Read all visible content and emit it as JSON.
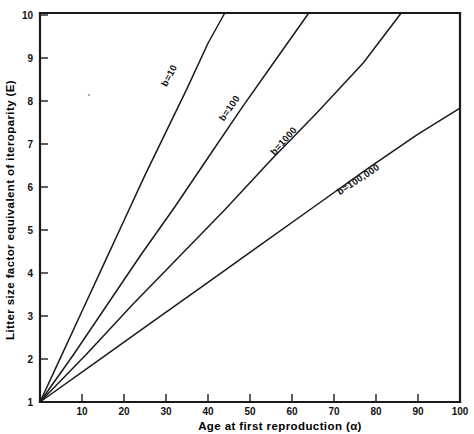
{
  "chart_data": {
    "type": "line",
    "title": "",
    "xlabel": "Age at first reproduction (α)",
    "ylabel": "Litter size factor equivalent of iteroparity (E)",
    "xlim": [
      0,
      100
    ],
    "ylim": [
      1,
      10
    ],
    "grid": false,
    "legend": "inline-curve-labels",
    "x_ticks": [
      10,
      20,
      30,
      40,
      50,
      60,
      70,
      80,
      90,
      100
    ],
    "x_tick_labels": [
      "10",
      "20",
      "30",
      "40",
      "50",
      "60",
      "70",
      "80",
      "90",
      "100"
    ],
    "y_ticks": [
      1,
      2,
      3,
      4,
      5,
      6,
      7,
      8,
      9,
      10
    ],
    "y_tick_labels": [
      "1",
      "2",
      "3",
      "4",
      "5",
      "6",
      "7",
      "8",
      "9",
      "10"
    ],
    "series": [
      {
        "name": "b=10",
        "label": "b=10",
        "x": [
          0,
          5,
          10,
          15,
          20,
          25,
          30,
          35,
          40,
          44
        ],
        "values": [
          1.0,
          2.05,
          3.1,
          4.15,
          5.2,
          6.25,
          7.25,
          8.25,
          9.3,
          10.0
        ]
      },
      {
        "name": "b=100",
        "label": "b=100",
        "x": [
          0,
          8,
          16,
          24,
          32,
          40,
          48,
          56,
          64
        ],
        "values": [
          1.0,
          2.1,
          3.25,
          4.4,
          5.5,
          6.65,
          7.8,
          8.9,
          10.0
        ]
      },
      {
        "name": "b=1000",
        "label": "b=1000",
        "x": [
          0,
          11,
          22,
          33,
          44,
          55,
          66,
          77,
          86
        ],
        "values": [
          1.0,
          2.1,
          3.25,
          4.35,
          5.45,
          6.6,
          7.7,
          8.85,
          10.0
        ]
      },
      {
        "name": "b=100,000",
        "label": "b=100,000",
        "x": [
          0,
          13,
          26,
          39,
          52,
          65,
          78,
          90,
          100
        ],
        "values": [
          1.0,
          1.9,
          2.8,
          3.7,
          4.6,
          5.5,
          6.4,
          7.2,
          7.8
        ]
      }
    ]
  },
  "axes": {
    "x_title": "Age at first reproduction (α)",
    "y_title": "Litter size factor equivalent of iteroparity (E)",
    "x_tick_labels": [
      "10",
      "20",
      "30",
      "40",
      "50",
      "60",
      "70",
      "80",
      "90",
      "100"
    ],
    "y_tick_labels": [
      "1",
      "2",
      "3",
      "4",
      "5",
      "6",
      "7",
      "8",
      "9",
      "10"
    ]
  },
  "curve_labels": {
    "b10": "b=10",
    "b100": "b=100",
    "b1000": "b=1000",
    "b100000": "b=100,000"
  }
}
